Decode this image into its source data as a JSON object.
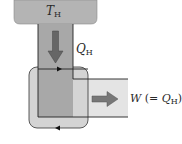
{
  "diagram": {
    "type": "heat-engine-energy-flow",
    "reservoir": {
      "label": "T",
      "subscript": "H"
    },
    "heat_input": {
      "label": "Q",
      "subscript": "H"
    },
    "work_output": {
      "label": "W",
      "paren_prefix": " (= ",
      "paren_var": "Q",
      "paren_subscript": "H",
      "paren_suffix": ")"
    },
    "colors": {
      "reservoir_fill": "#b4b4b4",
      "column_fill": "#a9a9a9",
      "engine_fill": "#d3d3d3",
      "channel_fill": "#e2e2e2",
      "arrow_fill": "#6e6e6e",
      "cycle_line": "#1e1e1e"
    }
  }
}
